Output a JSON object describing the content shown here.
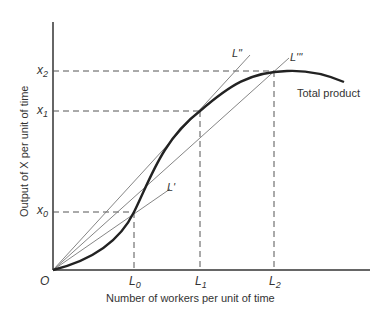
{
  "axes": {
    "x_label": "Number of workers per unit of time",
    "y_label": "Output of X per unit of time",
    "origin": "O"
  },
  "x_ticks": [
    {
      "base": "L",
      "sub": "0"
    },
    {
      "base": "L",
      "sub": "1"
    },
    {
      "base": "L",
      "sub": "2"
    }
  ],
  "y_ticks": [
    {
      "base": "x",
      "sub": "0"
    },
    {
      "base": "x",
      "sub": "1"
    },
    {
      "base": "x",
      "sub": "2"
    }
  ],
  "rays": [
    {
      "label": "L'",
      "through": "(L0, x0)"
    },
    {
      "label": "L\"",
      "through": "(L1, x1) tangent"
    },
    {
      "label": "L'''",
      "through": "(L2, x2)"
    }
  ],
  "curve_label": "Total product",
  "colors": {
    "curve": "#222222",
    "axis": "#333333",
    "ray": "#666666",
    "dashed": "#555555"
  }
}
